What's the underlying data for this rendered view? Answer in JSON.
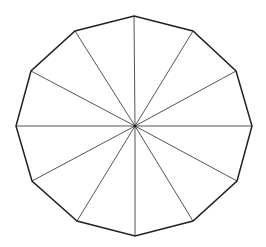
{
  "diagram": {
    "type": "regular-polygon-with-spokes",
    "sides": 12,
    "shape_name": "dodecagon",
    "center": [
      135,
      126
    ],
    "vertices": [
      [
        134,
        16
      ],
      [
        193,
        31
      ],
      [
        236,
        71
      ],
      [
        252,
        126
      ],
      [
        237,
        181
      ],
      [
        193,
        221
      ],
      [
        135,
        236
      ],
      [
        77,
        221
      ],
      [
        32,
        181
      ],
      [
        16,
        126
      ],
      [
        31,
        71
      ],
      [
        75,
        31
      ]
    ],
    "colors": {
      "background": "#ffffff",
      "outline": "#222222",
      "spokes": "#555555"
    },
    "stroke_widths": {
      "outline": 1.5,
      "spokes": 1
    }
  }
}
